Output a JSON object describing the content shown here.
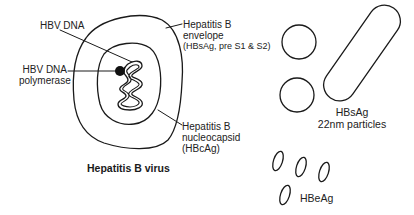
{
  "figure": {
    "virus": {
      "title": "Hepatitis B virus",
      "labels": {
        "hbv_dna": "HBV DNA",
        "polymerase_line1": "HBV DNA",
        "polymerase_line2": "polymerase",
        "envelope_line1": "Hepatitis B",
        "envelope_line2": "envelope",
        "envelope_line3": "(HBsAg, pre S1 & S2)",
        "nucleocapsid_line1": "Hepatitis B",
        "nucleocapsid_line2": "nucleocapsid",
        "nucleocapsid_line3": "(HBcAg)"
      }
    },
    "hbsag_particles": {
      "label_line1": "HBsAg",
      "label_line2": "22nm particles"
    },
    "hbeag": {
      "label": "HBeAg"
    }
  },
  "colors": {
    "stroke": "#1a1a1a",
    "background": "#ffffff"
  }
}
